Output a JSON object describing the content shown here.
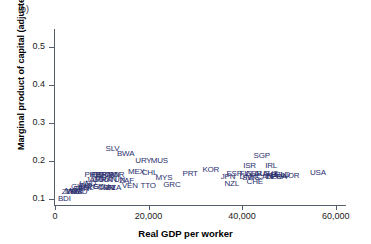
{
  "panel": {
    "label": "(b)"
  },
  "axes": {
    "xlabel": "Real GDP per worker",
    "ylabel": "Marginal product of capital (adjusted)",
    "xticks": [
      "0",
      "20,000",
      "40,000",
      "60,000"
    ],
    "yticks": [
      "0.1",
      "0.2",
      "0.3",
      "0.4",
      "0.5"
    ]
  },
  "colors": {
    "marker_text": "#2b2f6e",
    "axis": "#555f6b",
    "tick_text": "#222222"
  },
  "chart_data": {
    "type": "scatter",
    "title": "",
    "xlabel": "Real GDP per worker",
    "ylabel": "Marginal product of capital (adjusted)",
    "xlim": [
      0,
      62000
    ],
    "ylim": [
      0.085,
      0.545
    ],
    "xticks": [
      0,
      20000,
      40000,
      60000
    ],
    "yticks": [
      0.1,
      0.2,
      0.3,
      0.4,
      0.5
    ],
    "grid": false,
    "legend": null,
    "marker_style": "text-label",
    "points": [
      {
        "label": "BDI",
        "x": 2000,
        "y": 0.101
      },
      {
        "label": "ZWE",
        "x": 3300,
        "y": 0.12
      },
      {
        "label": "ZMB",
        "x": 4100,
        "y": 0.118
      },
      {
        "label": "MOZ",
        "x": 4000,
        "y": 0.122
      },
      {
        "label": "BGD",
        "x": 5100,
        "y": 0.118
      },
      {
        "label": "SEN",
        "x": 5600,
        "y": 0.127
      },
      {
        "label": "GHA",
        "x": 5200,
        "y": 0.132
      },
      {
        "label": "IND",
        "x": 6500,
        "y": 0.136
      },
      {
        "label": "BOL",
        "x": 6600,
        "y": 0.13
      },
      {
        "label": "HND",
        "x": 7000,
        "y": 0.14
      },
      {
        "label": "PHL",
        "x": 7900,
        "y": 0.163
      },
      {
        "label": "JAM",
        "x": 8200,
        "y": 0.152
      },
      {
        "label": "IDN",
        "x": 8900,
        "y": 0.163
      },
      {
        "label": "EGY",
        "x": 8600,
        "y": 0.132
      },
      {
        "label": "PER",
        "x": 9500,
        "y": 0.163
      },
      {
        "label": "COL",
        "x": 9700,
        "y": 0.152
      },
      {
        "label": "ECU",
        "x": 9900,
        "y": 0.132
      },
      {
        "label": "BRA",
        "x": 10400,
        "y": 0.163
      },
      {
        "label": "PRY",
        "x": 10300,
        "y": 0.152
      },
      {
        "label": "CHN",
        "x": 10900,
        "y": 0.13
      },
      {
        "label": "DOM",
        "x": 11300,
        "y": 0.163
      },
      {
        "label": "PAN",
        "x": 11600,
        "y": 0.152
      },
      {
        "label": "CRI",
        "x": 11500,
        "y": 0.131
      },
      {
        "label": "SLV",
        "x": 12300,
        "y": 0.232
      },
      {
        "label": "DZA",
        "x": 12500,
        "y": 0.13
      },
      {
        "label": "IRN",
        "x": 12400,
        "y": 0.163
      },
      {
        "label": "JOR",
        "x": 13200,
        "y": 0.163
      },
      {
        "label": "TUN",
        "x": 13300,
        "y": 0.152
      },
      {
        "label": "BWA",
        "x": 15100,
        "y": 0.218
      },
      {
        "label": "ZAF",
        "x": 15300,
        "y": 0.148
      },
      {
        "label": "VEN",
        "x": 16000,
        "y": 0.136
      },
      {
        "label": "MEX",
        "x": 17400,
        "y": 0.171
      },
      {
        "label": "URY",
        "x": 18900,
        "y": 0.2
      },
      {
        "label": "CHL",
        "x": 20200,
        "y": 0.17
      },
      {
        "label": "TTO",
        "x": 19900,
        "y": 0.134
      },
      {
        "label": "MUS",
        "x": 22300,
        "y": 0.2
      },
      {
        "label": "MYS",
        "x": 23300,
        "y": 0.155
      },
      {
        "label": "GRC",
        "x": 25000,
        "y": 0.138
      },
      {
        "label": "PRT",
        "x": 28900,
        "y": 0.167
      },
      {
        "label": "KOR",
        "x": 33300,
        "y": 0.176
      },
      {
        "label": "JPN",
        "x": 37000,
        "y": 0.158
      },
      {
        "label": "ESP",
        "x": 38300,
        "y": 0.166
      },
      {
        "label": "NZL",
        "x": 37800,
        "y": 0.14
      },
      {
        "label": "ISR",
        "x": 41600,
        "y": 0.188
      },
      {
        "label": "FIN",
        "x": 40800,
        "y": 0.166
      },
      {
        "label": "DNK",
        "x": 41200,
        "y": 0.158
      },
      {
        "label": "SWE",
        "x": 41900,
        "y": 0.155
      },
      {
        "label": "GBR",
        "x": 42500,
        "y": 0.166
      },
      {
        "label": "CHE",
        "x": 42700,
        "y": 0.145
      },
      {
        "label": "SGP",
        "x": 44200,
        "y": 0.215
      },
      {
        "label": "AUS",
        "x": 44300,
        "y": 0.166
      },
      {
        "label": "CAN",
        "x": 44800,
        "y": 0.158
      },
      {
        "label": "IRL",
        "x": 46200,
        "y": 0.188
      },
      {
        "label": "AUT",
        "x": 46000,
        "y": 0.166
      },
      {
        "label": "ITA",
        "x": 46400,
        "y": 0.16
      },
      {
        "label": "DEU",
        "x": 46800,
        "y": 0.158
      },
      {
        "label": "BEL",
        "x": 47600,
        "y": 0.164
      },
      {
        "label": "FRA",
        "x": 47900,
        "y": 0.158
      },
      {
        "label": "NLD",
        "x": 48600,
        "y": 0.164
      },
      {
        "label": "NOR",
        "x": 50400,
        "y": 0.16
      },
      {
        "label": "USA",
        "x": 56200,
        "y": 0.168
      }
    ]
  }
}
